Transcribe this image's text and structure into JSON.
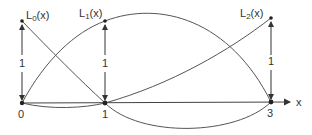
{
  "axis": {
    "label": "x",
    "ticks": [
      "0",
      "1",
      "3"
    ]
  },
  "curves": [
    {
      "name": "L0(x)",
      "main": "L",
      "sub": "0",
      "suffix": "(x)",
      "formula": "(x-1)(x-3)/3"
    },
    {
      "name": "L1(x)",
      "main": "L",
      "sub": "1",
      "suffix": "(x)",
      "formula": "-x(x-3)/2"
    },
    {
      "name": "L2(x)",
      "main": "L",
      "sub": "2",
      "suffix": "(x)",
      "formula": "x(x-1)/6"
    }
  ],
  "height_markers": [
    {
      "at": "0",
      "label": "1"
    },
    {
      "at": "1",
      "label": "1"
    },
    {
      "at": "3",
      "label": "1"
    }
  ],
  "colors": {
    "line": "#555555",
    "text": "#333333",
    "background": "#ffffff"
  }
}
